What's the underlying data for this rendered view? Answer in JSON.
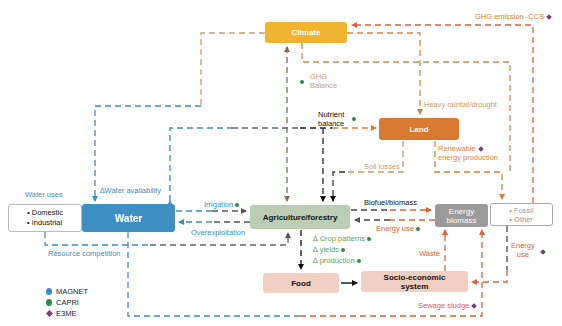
{
  "colors": {
    "climate": "#f1b431",
    "land": "#d97a30",
    "water": "#3d8fc4",
    "agriculture": "#bccdb5",
    "energy_biomass": "#9b9b9b",
    "food": "#f1cfc3",
    "socio": "#f1cfc3",
    "magnet": "#3a8fc2",
    "capri": "#2e8b46",
    "e3me": "#7a3f7a",
    "tan_link": "#c99c6f",
    "orange_link": "#e07b39",
    "red_link": "#e0603a",
    "blue_link": "#3a8fc2"
  },
  "nodes": {
    "climate": "Climate",
    "land": "Land",
    "water": "Water",
    "water_uses_items": [
      "• Domestic",
      "• Industrial"
    ],
    "agriculture": "Agriculture/forestry",
    "energy_biomass": "Energy biomass",
    "energy_other_items": [
      "• Fossil",
      "• Other"
    ],
    "food": "Food",
    "socio": "Socio-economic system"
  },
  "labels": {
    "ghg_emission": "GHG emission -CCS",
    "ghg_balance_1": "GHG",
    "ghg_balance_2": "Balance",
    "heavy_rainfall": "Heavy rainfall/drought",
    "nutrient_1": "Nutrient",
    "nutrient_2": "balance",
    "soil_losses": "Soil losses",
    "renewable_1": "Renewable",
    "renewable_2": "energy production",
    "biofuel": "Biofuel/biomass",
    "energy_use_agri": "Energy use",
    "crop_patterns": "∆ Crop patterns",
    "yields": "∆ yields",
    "production": "∆ production",
    "waste": "Waste",
    "energy_use_fossil_1": "Energy",
    "energy_use_fossil_2": "use",
    "sewage": "Sewage sludge",
    "irrigation": "Irrigation",
    "overexploitation": "Overexploitation",
    "water_availability": "∆Water availability",
    "water_uses": "Water uses",
    "resource_competition": "Resource competition"
  },
  "legend": [
    {
      "name": "MAGNET",
      "symbol": "circle",
      "color": "#3a8fc2"
    },
    {
      "name": "CAPRI",
      "symbol": "circle",
      "color": "#2e8b46"
    },
    {
      "name": "E3ME",
      "symbol": "diamond",
      "color": "#7a3f7a"
    }
  ]
}
